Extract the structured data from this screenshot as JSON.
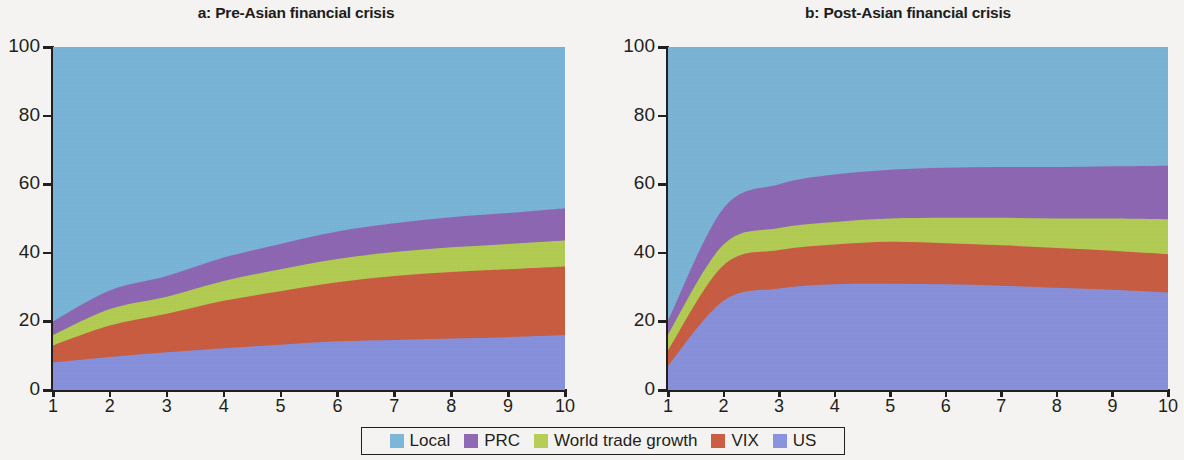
{
  "figure": {
    "background": "#f4f3f1",
    "axis_color": "#231f20"
  },
  "legend": {
    "position": "bottom-center",
    "items": [
      {
        "label": "Local",
        "color": "#7cb6d8"
      },
      {
        "label": "PRC",
        "color": "#9069b4"
      },
      {
        "label": "World trade growth",
        "color": "#b5cf56"
      },
      {
        "label": "VIX",
        "color": "#cb5f43"
      },
      {
        "label": "US",
        "color": "#8a93dd"
      }
    ]
  },
  "chart_data": [
    {
      "id": "a",
      "type": "area",
      "stacked": true,
      "title": "a: Pre-Asian financial crisis",
      "xlabel": "",
      "ylabel": "",
      "x": [
        1,
        2,
        3,
        4,
        5,
        6,
        7,
        8,
        9,
        10
      ],
      "xtick_labels": [
        "1",
        "2",
        "3",
        "4",
        "5",
        "6",
        "7",
        "8",
        "9",
        "10"
      ],
      "ytick_labels": [
        "0",
        "20",
        "40",
        "60",
        "80",
        "100"
      ],
      "yticks": [
        0,
        20,
        40,
        60,
        80,
        100
      ],
      "ylim": [
        0,
        100
      ],
      "xlim": [
        1,
        10
      ],
      "grid": false,
      "series": [
        {
          "name": "US",
          "color": "#8a93dd",
          "values": [
            8.0,
            9.6,
            11.0,
            12.2,
            13.2,
            14.2,
            14.6,
            15.0,
            15.4,
            16.0
          ]
        },
        {
          "name": "VIX",
          "color": "#cb5f43",
          "values": [
            5.0,
            9.2,
            11.2,
            13.8,
            15.6,
            17.2,
            18.6,
            19.4,
            19.8,
            20.0
          ]
        },
        {
          "name": "World trade growth",
          "color": "#b5cf56",
          "values": [
            3.0,
            4.8,
            5.0,
            5.8,
            6.4,
            6.8,
            7.0,
            7.2,
            7.4,
            7.6
          ]
        },
        {
          "name": "PRC",
          "color": "#9069b4",
          "values": [
            4.0,
            5.4,
            6.0,
            6.8,
            7.4,
            8.0,
            8.4,
            8.8,
            9.0,
            9.4
          ]
        },
        {
          "name": "Local",
          "color": "#7cb6d8",
          "values": [
            80.0,
            71.0,
            66.8,
            61.4,
            57.4,
            53.8,
            51.4,
            49.6,
            48.4,
            47.0
          ]
        }
      ],
      "cumulative_tops": {
        "US": [
          8.0,
          9.6,
          11.0,
          12.2,
          13.2,
          14.2,
          14.6,
          15.0,
          15.4,
          16.0
        ],
        "VIX": [
          13.0,
          18.8,
          22.2,
          26.0,
          28.8,
          31.4,
          33.2,
          34.4,
          35.2,
          36.0
        ],
        "World trade growth": [
          16.0,
          23.6,
          27.2,
          31.8,
          35.2,
          38.2,
          40.2,
          41.6,
          42.6,
          43.6
        ],
        "PRC": [
          20.0,
          29.0,
          33.2,
          38.6,
          42.6,
          46.2,
          48.6,
          50.4,
          51.6,
          53.0
        ],
        "Local": [
          100,
          100,
          100,
          100,
          100,
          100,
          100,
          100,
          100,
          100
        ]
      }
    },
    {
      "id": "b",
      "type": "area",
      "stacked": true,
      "title": "b: Post-Asian financial crisis",
      "xlabel": "",
      "ylabel": "",
      "x": [
        1,
        2,
        3,
        4,
        5,
        6,
        7,
        8,
        9,
        10
      ],
      "xtick_labels": [
        "1",
        "2",
        "3",
        "4",
        "5",
        "6",
        "7",
        "8",
        "9",
        "10"
      ],
      "ytick_labels": [
        "0",
        "20",
        "40",
        "60",
        "80",
        "100"
      ],
      "yticks": [
        0,
        20,
        40,
        60,
        80,
        100
      ],
      "ylim": [
        0,
        100
      ],
      "xlim": [
        1,
        10
      ],
      "grid": false,
      "series": [
        {
          "name": "US",
          "color": "#8a93dd",
          "values": [
            7.0,
            26.0,
            29.6,
            30.8,
            31.0,
            30.8,
            30.4,
            29.8,
            29.2,
            28.4
          ]
        },
        {
          "name": "VIX",
          "color": "#cb5f43",
          "values": [
            4.6,
            10.4,
            11.2,
            11.6,
            12.2,
            12.0,
            11.8,
            11.6,
            11.4,
            11.2
          ]
        },
        {
          "name": "World trade growth",
          "color": "#b5cf56",
          "values": [
            4.6,
            6.0,
            6.4,
            6.6,
            6.8,
            7.4,
            8.0,
            8.6,
            9.4,
            10.2
          ]
        },
        {
          "name": "PRC",
          "color": "#9069b4",
          "values": [
            4.0,
            10.6,
            12.8,
            13.8,
            14.2,
            14.6,
            14.8,
            15.0,
            15.2,
            15.6
          ]
        },
        {
          "name": "Local",
          "color": "#7cb6d8",
          "values": [
            79.8,
            47.0,
            40.0,
            37.2,
            35.8,
            35.2,
            35.0,
            35.0,
            34.8,
            34.6
          ]
        }
      ],
      "cumulative_tops": {
        "US": [
          7.0,
          26.0,
          29.6,
          30.8,
          31.0,
          30.8,
          30.4,
          29.8,
          29.2,
          28.4
        ],
        "VIX": [
          11.6,
          36.4,
          40.8,
          42.4,
          43.2,
          42.8,
          42.2,
          41.4,
          40.6,
          39.6
        ],
        "World trade growth": [
          16.2,
          42.4,
          47.2,
          49.0,
          50.0,
          50.2,
          50.2,
          50.0,
          50.0,
          49.8
        ],
        "PRC": [
          20.2,
          53.0,
          60.0,
          62.8,
          64.2,
          64.8,
          65.0,
          65.0,
          65.2,
          65.4
        ],
        "Local": [
          100,
          100,
          100,
          100,
          100,
          100,
          100,
          100,
          100,
          100
        ]
      }
    }
  ]
}
